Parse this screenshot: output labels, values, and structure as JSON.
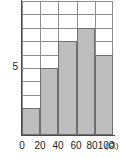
{
  "chart_data": {
    "type": "bar",
    "title": "",
    "subtitle": "",
    "xlabel": "点",
    "ylabel": "",
    "categories": [
      "0〜20",
      "20〜40",
      "40〜60",
      "60〜80",
      "80〜100"
    ],
    "bin_edges": [
      0,
      20,
      40,
      60,
      80,
      100
    ],
    "values": [
      2,
      5,
      7,
      8,
      6
    ],
    "xlim": [
      0,
      100
    ],
    "ylim": [
      0,
      10
    ],
    "x_tick_labels": [
      "0",
      "20",
      "40",
      "60",
      "80",
      "100"
    ],
    "y_tick_labels": [
      "5"
    ],
    "y_tick_values": [
      5
    ],
    "grid": true,
    "grid_rows": 10,
    "grid_cols": 5,
    "legend": null,
    "legend_position": "none",
    "annotations": [],
    "colors": {
      "bar_fill": "#bdbdbd",
      "bar_stroke": "#6e6e6e",
      "grid": "#8d8d8d",
      "axis": "#4a4a4a",
      "text": "#222222",
      "background": "#ffffff"
    }
  },
  "axes": {
    "x_unit_label": "(点)",
    "y_label_5": "5"
  }
}
